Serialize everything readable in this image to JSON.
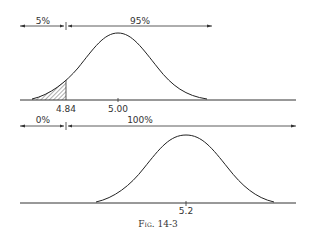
{
  "figure": {
    "caption": "Fig. 14-3",
    "top_panel": {
      "left_percent": "5%",
      "right_percent": "95%",
      "critical_value": "4.84",
      "mean": "5.00"
    },
    "bottom_panel": {
      "left_percent": "0%",
      "right_percent": "100%",
      "mean": "5.2"
    },
    "colors": {
      "ink": "#222222",
      "background": "#ffffff"
    }
  }
}
